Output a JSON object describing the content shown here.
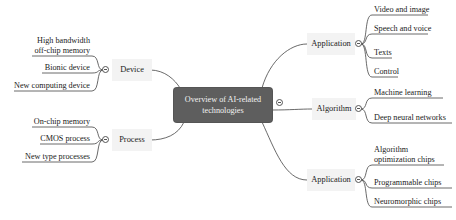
{
  "center": {
    "label_line1": "Overview of AI-related",
    "label_line2": "technologies"
  },
  "branches": {
    "application_top": {
      "label": "Application",
      "children": [
        "Video and image",
        "Speech and voice",
        "Texts",
        "Control"
      ]
    },
    "algorithm": {
      "label": "Algorithm",
      "children": [
        "Machine learning",
        "Deep neural networks"
      ]
    },
    "application_bottom": {
      "label": "Application",
      "children_line1": "Algorithm",
      "children_line2": "optimization chips",
      "children": [
        "Programmable chips",
        "Neuromorphic chips"
      ]
    },
    "device": {
      "label": "Device",
      "child0_line1": "High bandwidth",
      "child0_line2": "off-chip memory",
      "children": [
        "Bionic device",
        "New computing device"
      ]
    },
    "process": {
      "label": "Process",
      "children": [
        "On-chip memory",
        "CMOS process",
        "New type processes"
      ]
    }
  },
  "colors": {
    "center_bg": "#5e5e5e",
    "branch_bg": "#f3f3f3",
    "line": "#444444"
  }
}
